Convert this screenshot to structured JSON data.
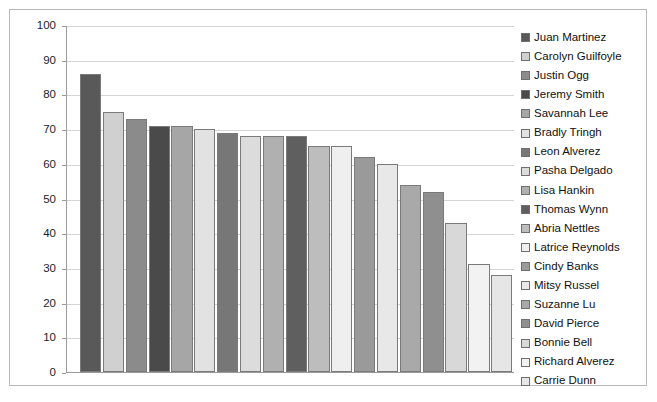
{
  "chart_data": {
    "type": "bar",
    "title": "",
    "subtitle": "",
    "xlabel": "",
    "ylabel": "",
    "ylim": [
      0,
      100
    ],
    "ytick_step": 10,
    "yticks": [
      100,
      90,
      80,
      70,
      60,
      50,
      40,
      30,
      20,
      10,
      0
    ],
    "grid": true,
    "legend_position": "right",
    "categories": [
      "Juan Martinez",
      "Carolyn Guilfoyle",
      "Justin Ogg",
      "Jeremy Smith",
      "Savannah Lee",
      "Bradly Tringh",
      "Leon Alverez",
      "Pasha Delgado",
      "Lisa Hankin",
      "Thomas Wynn",
      "Abria Nettles",
      "Latrice Reynolds",
      "Cindy Banks",
      "Mitsy Russel",
      "Suzanne Lu",
      "David Pierce",
      "Bonnie Bell",
      "Richard Alverez",
      "Carrie Dunn"
    ],
    "values": [
      86,
      75,
      73,
      71,
      71,
      70,
      69,
      68,
      68,
      68,
      65,
      65,
      62,
      60,
      54,
      52,
      43,
      31,
      28
    ],
    "colors": [
      "#595959",
      "#d0d0d0",
      "#8b8b8b",
      "#4a4a4a",
      "#a6a6a6",
      "#e2e2e2",
      "#777777",
      "#dcdcdc",
      "#b0b0b0",
      "#5f5f5f",
      "#bdbdbd",
      "#efefef",
      "#9a9a9a",
      "#e8e8e8",
      "#a9a9a9",
      "#8f8f8f",
      "#d8d8d8",
      "#f2f2f2",
      "#e6e6e6"
    ]
  },
  "legend": {
    "items": [
      {
        "label": "Juan Martinez",
        "color": "#595959"
      },
      {
        "label": "Carolyn Guilfoyle",
        "color": "#d0d0d0"
      },
      {
        "label": "Justin Ogg",
        "color": "#8b8b8b"
      },
      {
        "label": "Jeremy Smith",
        "color": "#4a4a4a"
      },
      {
        "label": "Savannah Lee",
        "color": "#a6a6a6"
      },
      {
        "label": "Bradly Tringh",
        "color": "#e2e2e2"
      },
      {
        "label": "Leon Alverez",
        "color": "#777777"
      },
      {
        "label": "Pasha Delgado",
        "color": "#dcdcdc"
      },
      {
        "label": "Lisa Hankin",
        "color": "#b0b0b0"
      },
      {
        "label": "Thomas Wynn",
        "color": "#5f5f5f"
      },
      {
        "label": "Abria Nettles",
        "color": "#bdbdbd"
      },
      {
        "label": "Latrice Reynolds",
        "color": "#efefef"
      },
      {
        "label": "Cindy Banks",
        "color": "#9a9a9a"
      },
      {
        "label": "Mitsy Russel",
        "color": "#e8e8e8"
      },
      {
        "label": "Suzanne Lu",
        "color": "#a9a9a9"
      },
      {
        "label": "David Pierce",
        "color": "#8f8f8f"
      },
      {
        "label": "Bonnie Bell",
        "color": "#d8d8d8"
      },
      {
        "label": "Richard Alverez",
        "color": "#f2f2f2"
      },
      {
        "label": "Carrie Dunn",
        "color": "#e6e6e6"
      }
    ]
  },
  "style": {
    "plot_background": "#ffffff",
    "frame_border": "#b9b9b9",
    "gridline_color": "#d4d4d4",
    "axis_color": "#9a9a9a",
    "bar_border": "#7a7a7a",
    "text_color": "#111111"
  }
}
